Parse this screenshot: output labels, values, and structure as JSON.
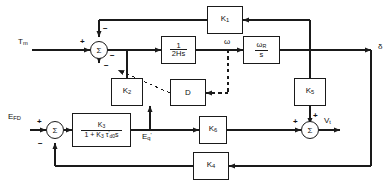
{
  "diagram": {
    "colors": {
      "line": "#1a1a1a",
      "background": "#ffffff",
      "text": "#111111"
    }
  },
  "inputs": [
    {
      "id": "tm",
      "label_main": "T",
      "label_sub": "m",
      "name": "mechanical-torque-input"
    },
    {
      "id": "efd",
      "label_main": "E",
      "label_sub": "FD",
      "name": "field-voltage-input"
    }
  ],
  "outputs": [
    {
      "id": "delta",
      "label": "δ",
      "name": "rotor-angle-output"
    },
    {
      "id": "vt",
      "label_main": "V",
      "label_sub": "t",
      "name": "terminal-voltage-output"
    }
  ],
  "signals": [
    {
      "id": "omega",
      "label": "ω",
      "name": "speed-signal-label"
    },
    {
      "id": "eq",
      "label_main": "E",
      "label_sub": "q",
      "label_sup": "'",
      "name": "q-axis-voltage-label"
    }
  ],
  "blocks": [
    {
      "id": "k1",
      "label": "K",
      "sub": "1",
      "name": "gain-block-k1"
    },
    {
      "id": "inertia",
      "num": "1",
      "den": "2Hs",
      "name": "inertia-block"
    },
    {
      "id": "integrator",
      "num": "ωR",
      "den": "s",
      "name": "integrator-block"
    },
    {
      "id": "k2",
      "label": "K",
      "sub": "2",
      "name": "gain-block-k2"
    },
    {
      "id": "damping",
      "label": "D",
      "name": "damping-block"
    },
    {
      "id": "k5",
      "label": "K",
      "sub": "5",
      "name": "gain-block-k5"
    },
    {
      "id": "exciter",
      "num": "K3",
      "den": "1 + K3 τ'd0 s",
      "name": "exciter-transfer-block"
    },
    {
      "id": "k6",
      "label": "K",
      "sub": "6",
      "name": "gain-block-k6"
    },
    {
      "id": "k4",
      "label": "K",
      "sub": "4",
      "name": "gain-block-k4"
    }
  ],
  "summers": [
    {
      "id": "sum-torque",
      "symbol": "Σ",
      "name": "torque-summing-junction",
      "signs": [
        "+",
        "−",
        "−",
        "−"
      ]
    },
    {
      "id": "sum-field",
      "symbol": "Σ",
      "name": "field-summing-junction",
      "signs": [
        "+",
        "−"
      ]
    },
    {
      "id": "sum-voltage",
      "symbol": "Σ",
      "name": "voltage-summing-junction",
      "signs": [
        "+",
        "+"
      ]
    }
  ],
  "signs": {
    "plus": "+",
    "minus": "−"
  }
}
